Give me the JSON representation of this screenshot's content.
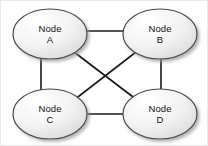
{
  "diagram": {
    "type": "undirected-graph",
    "background_color": "#ffffff",
    "border_color": "#e8e8e8",
    "node_fill_light": "#ffffff",
    "node_fill_dark": "#dcdcdc",
    "node_stroke_color": "#4a4a4a",
    "node_stroke_width": 1.2,
    "edge_color": "#1a1a1a",
    "edge_width": 1.6,
    "shadow_color": "#b0b0b0",
    "label_color": "#111111",
    "nodes": [
      {
        "id": "A",
        "label": "Node\nA",
        "label_line1": "Node",
        "label_line2": "A",
        "cx": 49,
        "cy": 33,
        "rx": 37,
        "ry": 25
      },
      {
        "id": "B",
        "label": "Node\nB",
        "label_line1": "Node",
        "label_line2": "B",
        "cx": 159,
        "cy": 33,
        "rx": 37,
        "ry": 25
      },
      {
        "id": "C",
        "label": "Node\nC",
        "label_line1": "Node",
        "label_line2": "C",
        "cx": 49,
        "cy": 113,
        "rx": 37,
        "ry": 25
      },
      {
        "id": "D",
        "label": "Node\nD",
        "label_line1": "Node",
        "label_line2": "D",
        "cx": 159,
        "cy": 113,
        "rx": 37,
        "ry": 25
      }
    ],
    "edges": [
      {
        "id": "edge-a-b",
        "from": "A",
        "to": "B",
        "x1": 86,
        "y1": 30,
        "x2": 122,
        "y2": 30
      },
      {
        "id": "edge-a-c",
        "from": "A",
        "to": "C",
        "x1": 40,
        "y1": 57,
        "x2": 40,
        "y2": 89
      },
      {
        "id": "edge-b-d",
        "from": "B",
        "to": "D",
        "x1": 160,
        "y1": 58,
        "x2": 160,
        "y2": 89
      },
      {
        "id": "edge-c-d",
        "from": "C",
        "to": "D",
        "x1": 86,
        "y1": 113,
        "x2": 122,
        "y2": 113
      },
      {
        "id": "edge-a-d",
        "from": "A",
        "to": "D",
        "x1": 73,
        "y1": 51,
        "x2": 136,
        "y2": 99
      },
      {
        "id": "edge-b-c",
        "from": "B",
        "to": "C",
        "x1": 135,
        "y1": 51,
        "x2": 73,
        "y2": 99
      }
    ]
  }
}
